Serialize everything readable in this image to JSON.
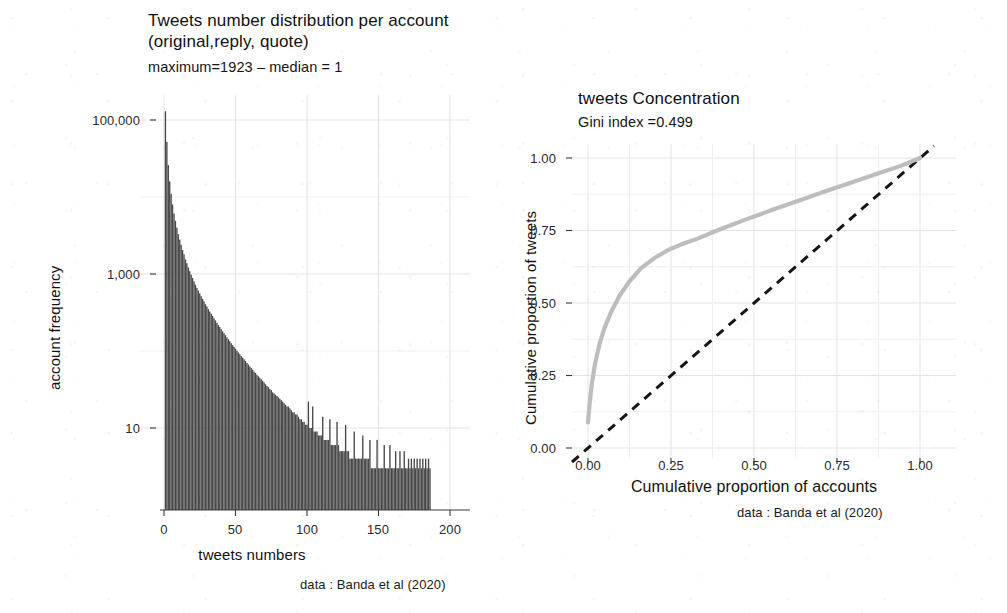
{
  "figure": {
    "background_color": "#ffffff",
    "bar_color": "#494949",
    "lorenz_color": "#bdbdbd",
    "equality_color": "#161616"
  },
  "left_panel": {
    "title": "Tweets number distribution per account\n (original,reply, quote)",
    "subtitle": "maximum=1923 – median = 1",
    "xlabel": "tweets numbers",
    "ylabel": "account frequency",
    "caption": "data : Banda et al (2020)",
    "y_ticks": [
      "10",
      "1,000",
      "100,000"
    ],
    "x_ticks": [
      "0",
      "50",
      "100",
      "150",
      "200"
    ]
  },
  "right_panel": {
    "title": "tweets Concentration",
    "subtitle": "Gini index =0.499",
    "xlabel": "Cumulative proportion of accounts",
    "ylabel": "Cumulative proportion of tweets",
    "caption": "data : Banda et al (2020)",
    "y_ticks": [
      "0.00",
      "0.25",
      "0.50",
      "0.75",
      "1.00"
    ],
    "x_ticks": [
      "0.00",
      "0.25",
      "0.50",
      "0.75",
      "1.00"
    ]
  },
  "chart_data": [
    {
      "type": "bar",
      "id": "tweets-histogram",
      "title": "Tweets number distribution per account (original,reply, quote)",
      "subtitle": "maximum=1923 - median = 1",
      "caption": "data : Banda et al (2020)",
      "xlabel": "tweets numbers",
      "ylabel": "account frequency",
      "xlim": [
        -4,
        205
      ],
      "ylim": [
        3,
        160000
      ],
      "yscale": "log",
      "xscale": "linear",
      "grid": true,
      "legend": "none",
      "y_tick_values": [
        10,
        1000,
        100000
      ],
      "y_tick_labels": [
        "10",
        "1,000",
        "100,000"
      ],
      "x_tick_values": [
        0,
        50,
        100,
        150,
        200
      ],
      "x_tick_labels": [
        "0",
        "50",
        "100",
        "150",
        "200"
      ],
      "annotations": {
        "maximum": 1923,
        "median": 1
      },
      "x": [
        1,
        2,
        3,
        4,
        5,
        6,
        7,
        8,
        9,
        10,
        11,
        12,
        13,
        14,
        15,
        16,
        17,
        18,
        19,
        20,
        21,
        22,
        23,
        24,
        25,
        26,
        27,
        28,
        29,
        30,
        31,
        32,
        33,
        34,
        35,
        36,
        37,
        38,
        39,
        40,
        41,
        42,
        43,
        44,
        45,
        46,
        47,
        48,
        49,
        50,
        51,
        52,
        53,
        54,
        55,
        56,
        57,
        58,
        59,
        60,
        61,
        62,
        63,
        64,
        65,
        66,
        67,
        68,
        69,
        70,
        71,
        72,
        73,
        74,
        75,
        76,
        77,
        78,
        79,
        80,
        81,
        82,
        83,
        84,
        85,
        86,
        87,
        88,
        89,
        90,
        91,
        92,
        93,
        94,
        95,
        96,
        97,
        98,
        99,
        100,
        101,
        102,
        103,
        104,
        105,
        106,
        107,
        108,
        109,
        110,
        111,
        112,
        113,
        114,
        115,
        116,
        117,
        118,
        119,
        120,
        121,
        122,
        123,
        124,
        125,
        126,
        127,
        128,
        129,
        130,
        131,
        132,
        133,
        134,
        135,
        136,
        137,
        138,
        139,
        140,
        141,
        142,
        143,
        144,
        145,
        146,
        147,
        148,
        149,
        150,
        151,
        152,
        153,
        154,
        155,
        156,
        157,
        158,
        159,
        160,
        161,
        162,
        163,
        164,
        165,
        166,
        167,
        168,
        169,
        170,
        171,
        172,
        173,
        174,
        175,
        176,
        177,
        178,
        179,
        180,
        181,
        182,
        183,
        184,
        185,
        186,
        187,
        188,
        189,
        190,
        191,
        192,
        193,
        194,
        195
      ],
      "values": [
        130000,
        52000,
        26000,
        16000,
        11000,
        8000,
        6100,
        4900,
        4000,
        3300,
        2800,
        2400,
        2050,
        1800,
        1550,
        1380,
        1220,
        1090,
        980,
        890,
        800,
        730,
        660,
        610,
        560,
        515,
        475,
        440,
        405,
        378,
        350,
        325,
        305,
        285,
        265,
        250,
        232,
        218,
        205,
        192,
        180,
        170,
        160,
        150,
        142,
        134,
        126,
        119,
        113,
        107,
        101,
        96,
        91,
        86,
        82,
        78,
        74,
        70,
        67,
        63,
        60,
        57,
        54,
        52,
        49,
        47,
        45,
        43,
        41,
        39,
        37,
        35,
        34,
        32,
        31,
        29,
        28,
        27,
        26,
        25,
        24,
        23,
        22,
        21,
        20,
        19,
        19,
        18,
        17,
        16,
        16,
        15,
        15,
        14,
        13,
        13,
        12,
        12,
        11,
        11,
        22,
        10,
        10,
        19,
        9,
        9,
        9,
        8,
        8,
        8,
        14,
        7,
        7,
        7,
        7,
        13,
        6,
        6,
        6,
        6,
        12,
        6,
        5,
        5,
        5,
        5,
        11,
        5,
        5,
        4,
        4,
        4,
        9,
        4,
        4,
        4,
        4,
        4,
        8,
        4,
        4,
        4,
        4,
        7,
        3,
        3,
        3,
        3,
        7,
        3,
        3,
        3,
        3,
        6,
        3,
        3,
        3,
        6,
        3,
        3,
        3,
        5,
        3,
        3,
        5,
        3,
        3,
        5,
        3,
        3,
        4,
        3,
        4,
        3,
        4,
        3,
        4,
        3,
        4,
        3,
        4,
        3,
        4,
        3,
        4,
        3
      ]
    },
    {
      "type": "line",
      "id": "lorenz-curve",
      "title": "tweets Concentration",
      "subtitle": "Gini index =0.499",
      "caption": "data : Banda et al (2020)",
      "xlabel": "Cumulative proportion of accounts",
      "ylabel": "Cumulative proportion of tweets",
      "xlim": [
        0,
        1
      ],
      "ylim": [
        0,
        1
      ],
      "grid": true,
      "legend": "none",
      "gini_index": 0.499,
      "x_tick_values": [
        0.0,
        0.25,
        0.5,
        0.75,
        1.0
      ],
      "x_tick_labels": [
        "0.00",
        "0.25",
        "0.50",
        "0.75",
        "1.00"
      ],
      "y_tick_values": [
        0.0,
        0.25,
        0.5,
        0.75,
        1.0
      ],
      "y_tick_labels": [
        "0.00",
        "0.25",
        "0.50",
        "0.75",
        "1.00"
      ],
      "series": [
        {
          "name": "Lorenz curve",
          "style": "solid",
          "color": "#bdbdbd",
          "x": [
            0.0,
            0.005,
            0.012,
            0.022,
            0.035,
            0.05,
            0.07,
            0.095,
            0.125,
            0.16,
            0.2,
            0.245,
            0.29,
            0.33,
            0.4,
            0.48,
            0.56,
            0.64,
            0.72,
            0.8,
            0.88,
            0.94,
            1.0
          ],
          "y": [
            0.088,
            0.155,
            0.225,
            0.295,
            0.36,
            0.415,
            0.47,
            0.525,
            0.575,
            0.62,
            0.655,
            0.685,
            0.706,
            0.722,
            0.755,
            0.79,
            0.823,
            0.855,
            0.887,
            0.918,
            0.949,
            0.972,
            1.0
          ]
        },
        {
          "name": "Line of equality",
          "style": "dashed",
          "color": "#161616",
          "x": [
            0.0,
            1.0
          ],
          "y": [
            0.0,
            1.0
          ]
        }
      ]
    }
  ]
}
